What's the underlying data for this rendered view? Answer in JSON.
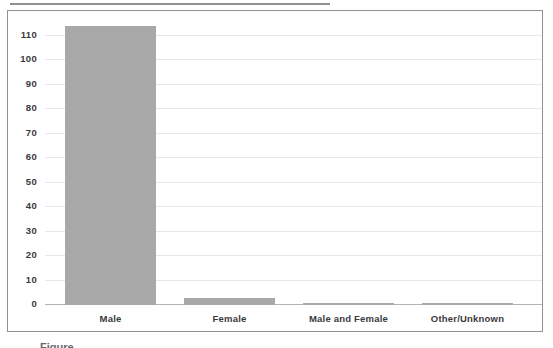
{
  "chart_data": {
    "type": "bar",
    "title": "",
    "categories": [
      "Male",
      "Female",
      "Male and Female",
      "Other/Unknown"
    ],
    "values": [
      114,
      3,
      1,
      1
    ],
    "xlabel": "",
    "ylabel": "",
    "ylim": [
      0,
      120
    ],
    "yticks": [
      0,
      10,
      20,
      30,
      40,
      50,
      60,
      70,
      80,
      90,
      100,
      110
    ],
    "grid": true,
    "legend": false,
    "colors": {
      "bar": "#a8a8a8",
      "gridline": "#e7e7e7",
      "baseline": "#b4b4b4",
      "box_border": "#919191",
      "label": "#3a3a3a"
    }
  },
  "caption": {
    "partial_text": "Figure"
  }
}
